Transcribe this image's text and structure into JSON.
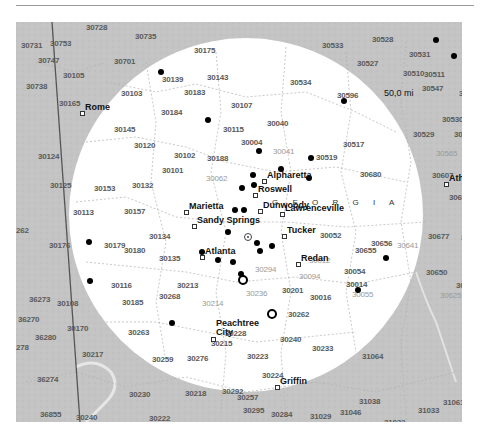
{
  "map": {
    "radius_label": "50,0 mi",
    "state_label": "G E O R G I A",
    "colors": {
      "outside": "#c4c4c4",
      "inside": "#ffffff",
      "marker": "#000000"
    },
    "cities": [
      {
        "name": "Rome",
        "x": 68,
        "y": 85
      },
      {
        "name": "Alpharetta",
        "x": 250,
        "y": 153
      },
      {
        "name": "Roswell",
        "x": 241,
        "y": 167
      },
      {
        "name": "Marietta",
        "x": 172,
        "y": 184
      },
      {
        "name": "Dunwoody",
        "x": 246,
        "y": 183
      },
      {
        "name": "Sandy Springs",
        "x": 180,
        "y": 198
      },
      {
        "name": "Lawrenceville",
        "x": 268,
        "y": 186
      },
      {
        "name": "Tucker",
        "x": 270,
        "y": 208
      },
      {
        "name": "Atlanta",
        "x": 188,
        "y": 229
      },
      {
        "name": "Redan",
        "x": 284,
        "y": 236
      },
      {
        "name": "Athens",
        "x": 432,
        "y": 156
      },
      {
        "name": "Peachtree City",
        "x": 199,
        "y": 311
      },
      {
        "name": "Griffin",
        "x": 263,
        "y": 359
      },
      {
        "name": "LaGrange",
        "x": 93,
        "y": 410
      }
    ],
    "zip_labels": [
      {
        "text": "30728",
        "x": 70,
        "y": 2
      },
      {
        "text": "30735",
        "x": 119,
        "y": 11
      },
      {
        "text": "30731",
        "x": 5,
        "y": 20
      },
      {
        "text": "30753",
        "x": 34,
        "y": 18
      },
      {
        "text": "30175",
        "x": 178,
        "y": 25
      },
      {
        "text": "30533",
        "x": 306,
        "y": 20
      },
      {
        "text": "30528",
        "x": 356,
        "y": 14
      },
      {
        "text": "30531",
        "x": 393,
        "y": 29
      },
      {
        "text": "30747",
        "x": 22,
        "y": 35
      },
      {
        "text": "30701",
        "x": 98,
        "y": 36
      },
      {
        "text": "30527",
        "x": 341,
        "y": 38
      },
      {
        "text": "30139",
        "x": 146,
        "y": 54
      },
      {
        "text": "30143",
        "x": 191,
        "y": 52
      },
      {
        "text": "30105",
        "x": 47,
        "y": 50
      },
      {
        "text": "30510",
        "x": 387,
        "y": 48
      },
      {
        "text": "30511",
        "x": 408,
        "y": 49
      },
      {
        "text": "30738",
        "x": 10,
        "y": 61
      },
      {
        "text": "30103",
        "x": 105,
        "y": 68
      },
      {
        "text": "30183",
        "x": 168,
        "y": 67
      },
      {
        "text": "30534",
        "x": 274,
        "y": 57
      },
      {
        "text": "30547",
        "x": 406,
        "y": 63
      },
      {
        "text": "30521",
        "x": 443,
        "y": 68
      },
      {
        "text": "30165",
        "x": 43,
        "y": 78
      },
      {
        "text": "30107",
        "x": 215,
        "y": 80
      },
      {
        "text": "30596",
        "x": 321,
        "y": 70
      },
      {
        "text": "30184",
        "x": 145,
        "y": 87
      },
      {
        "text": "30530",
        "x": 426,
        "y": 94
      },
      {
        "text": "30145",
        "x": 98,
        "y": 104
      },
      {
        "text": "30115",
        "x": 207,
        "y": 104
      },
      {
        "text": "30040",
        "x": 251,
        "y": 98
      },
      {
        "text": "30529",
        "x": 397,
        "y": 109
      },
      {
        "text": "30633",
        "x": 438,
        "y": 109
      },
      {
        "text": "30120",
        "x": 118,
        "y": 120
      },
      {
        "text": "30004",
        "x": 225,
        "y": 117
      },
      {
        "text": "30517",
        "x": 327,
        "y": 119
      },
      {
        "text": "30124",
        "x": 22,
        "y": 131
      },
      {
        "text": "30102",
        "x": 158,
        "y": 130
      },
      {
        "text": "30188",
        "x": 191,
        "y": 133
      },
      {
        "text": "30519",
        "x": 300,
        "y": 132
      },
      {
        "text": "30101",
        "x": 146,
        "y": 145
      },
      {
        "text": "30680",
        "x": 344,
        "y": 149
      },
      {
        "text": "30607",
        "x": 416,
        "y": 150
      },
      {
        "text": "30125",
        "x": 34,
        "y": 160
      },
      {
        "text": "30153",
        "x": 78,
        "y": 163
      },
      {
        "text": "30132",
        "x": 116,
        "y": 160
      },
      {
        "text": "30113",
        "x": 57,
        "y": 187
      },
      {
        "text": "30157",
        "x": 108,
        "y": 186
      },
      {
        "text": "30656",
        "x": 355,
        "y": 218
      },
      {
        "text": "30605",
        "x": 433,
        "y": 172
      },
      {
        "text": "30134",
        "x": 133,
        "y": 211
      },
      {
        "text": "30052",
        "x": 304,
        "y": 210
      },
      {
        "text": "30655",
        "x": 339,
        "y": 225
      },
      {
        "text": "30677",
        "x": 412,
        "y": 211
      },
      {
        "text": "30176",
        "x": 33,
        "y": 220
      },
      {
        "text": "30179",
        "x": 88,
        "y": 220
      },
      {
        "text": "30180",
        "x": 108,
        "y": 225
      },
      {
        "text": "30135",
        "x": 143,
        "y": 233
      },
      {
        "text": "30054",
        "x": 328,
        "y": 246
      },
      {
        "text": "30650",
        "x": 410,
        "y": 247
      },
      {
        "text": "30014",
        "x": 330,
        "y": 259
      },
      {
        "text": "30116",
        "x": 95,
        "y": 260
      },
      {
        "text": "30213",
        "x": 161,
        "y": 260
      },
      {
        "text": "30201",
        "x": 266,
        "y": 265
      },
      {
        "text": "30016",
        "x": 294,
        "y": 272
      },
      {
        "text": "36273",
        "x": 13,
        "y": 274
      },
      {
        "text": "30108",
        "x": 41,
        "y": 278
      },
      {
        "text": "30185",
        "x": 106,
        "y": 277
      },
      {
        "text": "30268",
        "x": 143,
        "y": 271
      },
      {
        "text": "30262",
        "x": 272,
        "y": 289
      },
      {
        "text": "36270",
        "x": 2,
        "y": 294
      },
      {
        "text": "30170",
        "x": 51,
        "y": 303
      },
      {
        "text": "30263",
        "x": 112,
        "y": 307
      },
      {
        "text": "30228",
        "x": 209,
        "y": 308
      },
      {
        "text": "30240",
        "x": 264,
        "y": 314
      },
      {
        "text": "30233",
        "x": 296,
        "y": 323
      },
      {
        "text": "30215",
        "x": 195,
        "y": 318
      },
      {
        "text": "30217",
        "x": 66,
        "y": 329
      },
      {
        "text": "30259",
        "x": 136,
        "y": 334
      },
      {
        "text": "30276",
        "x": 171,
        "y": 333
      },
      {
        "text": "30223",
        "x": 231,
        "y": 331
      },
      {
        "text": "31064",
        "x": 346,
        "y": 331
      },
      {
        "text": "36274",
        "x": 21,
        "y": 354
      },
      {
        "text": "30224",
        "x": 246,
        "y": 350
      },
      {
        "text": "30292",
        "x": 206,
        "y": 366
      },
      {
        "text": "30230",
        "x": 113,
        "y": 369
      },
      {
        "text": "30218",
        "x": 169,
        "y": 368
      },
      {
        "text": "30257",
        "x": 221,
        "y": 372
      },
      {
        "text": "31038",
        "x": 343,
        "y": 376
      },
      {
        "text": "31061",
        "x": 427,
        "y": 377
      },
      {
        "text": "30295",
        "x": 227,
        "y": 385
      },
      {
        "text": "31033",
        "x": 402,
        "y": 385
      },
      {
        "text": "36855",
        "x": 24,
        "y": 389
      },
      {
        "text": "30240",
        "x": 60,
        "y": 392
      },
      {
        "text": "30222",
        "x": 133,
        "y": 393
      },
      {
        "text": "30284",
        "x": 255,
        "y": 389
      },
      {
        "text": "31029",
        "x": 294,
        "y": 391
      },
      {
        "text": "31046",
        "x": 324,
        "y": 387
      },
      {
        "text": "31032",
        "x": 368,
        "y": 397
      }
    ],
    "faint_zip_labels": [
      {
        "text": "30041",
        "x": 257,
        "y": 126
      },
      {
        "text": "30062",
        "x": 190,
        "y": 153
      },
      {
        "text": "30641",
        "x": 381,
        "y": 220
      },
      {
        "text": "30294",
        "x": 239,
        "y": 244
      },
      {
        "text": "30012",
        "x": 293,
        "y": 235
      },
      {
        "text": "30094",
        "x": 283,
        "y": 251
      },
      {
        "text": "30214",
        "x": 186,
        "y": 278
      },
      {
        "text": "30236",
        "x": 230,
        "y": 268
      },
      {
        "text": "30055",
        "x": 336,
        "y": 269
      },
      {
        "text": "30625",
        "x": 424,
        "y": 270
      },
      {
        "text": "30565",
        "x": 420,
        "y": 128
      }
    ],
    "edge_zip_labels": [
      {
        "text": "3055",
        "x": 448,
        "y": 29
      },
      {
        "text": "3066",
        "x": 445,
        "y": 212
      },
      {
        "text": "306",
        "x": 448,
        "y": 232
      },
      {
        "text": "3064",
        "x": 440,
        "y": 260
      },
      {
        "text": "306",
        "x": 446,
        "y": 153
      },
      {
        "text": "262",
        "x": 0,
        "y": 205
      },
      {
        "text": "278",
        "x": 0,
        "y": 322
      },
      {
        "text": "36280",
        "x": 19,
        "y": 312
      }
    ],
    "dots": [
      {
        "x": 420,
        "y": 18
      },
      {
        "x": 438,
        "y": 34
      },
      {
        "x": 328,
        "y": 79
      },
      {
        "x": 145,
        "y": 50
      },
      {
        "x": 192,
        "y": 98
      },
      {
        "x": 243,
        "y": 129
      },
      {
        "x": 295,
        "y": 136
      },
      {
        "x": 265,
        "y": 147
      },
      {
        "x": 237,
        "y": 153
      },
      {
        "x": 293,
        "y": 156
      },
      {
        "x": 238,
        "y": 163
      },
      {
        "x": 226,
        "y": 166
      },
      {
        "x": 219,
        "y": 188
      },
      {
        "x": 228,
        "y": 188
      },
      {
        "x": 212,
        "y": 210
      },
      {
        "x": 241,
        "y": 221
      },
      {
        "x": 256,
        "y": 224
      },
      {
        "x": 244,
        "y": 229
      },
      {
        "x": 186,
        "y": 230
      },
      {
        "x": 202,
        "y": 238
      },
      {
        "x": 217,
        "y": 240
      },
      {
        "x": 225,
        "y": 252
      },
      {
        "x": 73,
        "y": 220
      },
      {
        "x": 74,
        "y": 259
      },
      {
        "x": 370,
        "y": 236
      },
      {
        "x": 342,
        "y": 268
      },
      {
        "x": 156,
        "y": 301
      },
      {
        "x": 75,
        "y": 411
      }
    ],
    "rings": [
      {
        "x": 227,
        "y": 258
      },
      {
        "x": 256,
        "y": 292
      }
    ],
    "center": {
      "x": 232,
      "y": 215
    }
  }
}
